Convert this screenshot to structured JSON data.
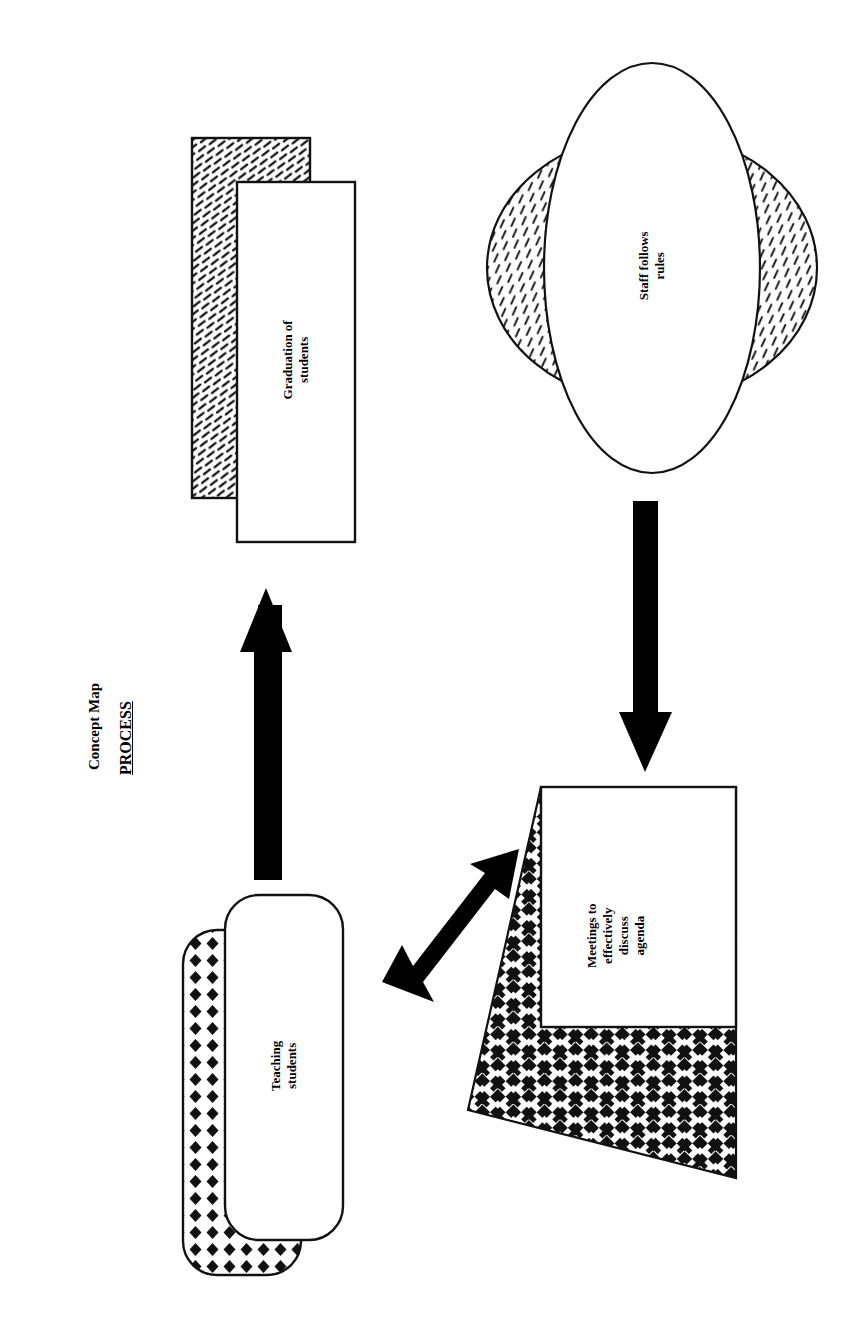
{
  "page": {
    "orientation": "rotated-90-counterclockwise",
    "background_color": "#ffffff",
    "ink_color": "#000000"
  },
  "header": {
    "title": "Concept Map",
    "subtitle": "PROCESS"
  },
  "diagram": {
    "type": "concept-map",
    "nodes": [
      {
        "id": "graduation",
        "label": "Graduation of\nstudents",
        "shape": "rectangle",
        "fill": "#ffffff",
        "shadow_pattern": "dense-diagonal-dash",
        "shadow_offset": "up-left"
      },
      {
        "id": "staff-rules",
        "label": "Staff follows\nrules",
        "shape": "ellipse",
        "fill": "#ffffff",
        "shadow_pattern": "slanted-tick-hatch",
        "shadow_offset": "perpendicular-both-sides"
      },
      {
        "id": "teaching",
        "label": "Teaching\nstudents",
        "shape": "rounded-rectangle",
        "fill": "#ffffff",
        "shadow_pattern": "diamond-grid",
        "shadow_offset": "down-left"
      },
      {
        "id": "meetings",
        "label": "Meetings to\neffectively\ndiscuss\nagenda",
        "shape": "rectangle",
        "fill": "#ffffff",
        "shadow_pattern": "houndstooth-check",
        "shadow_offset": "extruded-diagonal"
      }
    ],
    "connectors": [
      {
        "id": "teaching-to-graduation",
        "from": "teaching",
        "to": "graduation",
        "style": "thick-solid-block",
        "heads": "single",
        "color": "#000000"
      },
      {
        "id": "staff-to-meetings",
        "from": "staff-rules",
        "to": "meetings",
        "style": "thick-solid-block",
        "heads": "single",
        "color": "#000000"
      },
      {
        "id": "teaching-meetings-bidirectional",
        "from": "teaching",
        "to": "meetings",
        "style": "thick-solid-block-diagonal",
        "heads": "double",
        "color": "#000000"
      }
    ]
  }
}
